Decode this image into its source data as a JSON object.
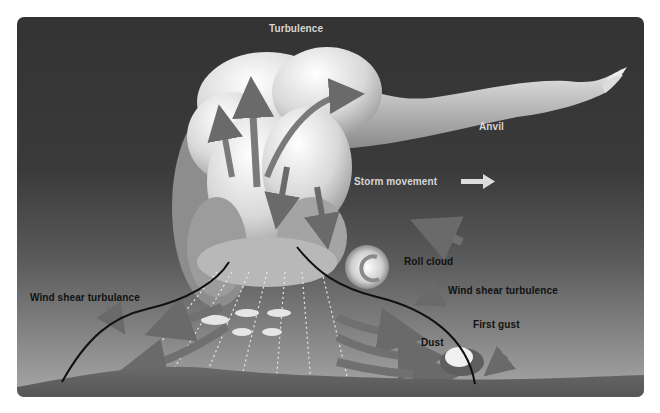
{
  "diagram": {
    "labels": {
      "turbulence": "Turbulence",
      "anvil": "Anvil",
      "storm_movement": "Storm movement",
      "roll_cloud": "Roll cloud",
      "wind_shear_left": "Wind shear turbulance",
      "wind_shear_right": "Wind shear turbulence",
      "first_gust": "First gust",
      "dust": "Dust"
    },
    "icons": {
      "storm_movement_arrow": "arrow-right",
      "roll_cloud": "spiral-vortex",
      "dust_cloud": "dust-burst"
    },
    "colors": {
      "background_top": "#333333",
      "background_bottom": "#a8a8a8",
      "ground": "#5a5a5a",
      "cloud_light": "#f4f4f4",
      "cloud_shadow": "#8a8a8a",
      "flow_arrows": "#6e6e6e",
      "gust_front_line": "#111111",
      "rain_lines": "#e8e8e8"
    }
  }
}
